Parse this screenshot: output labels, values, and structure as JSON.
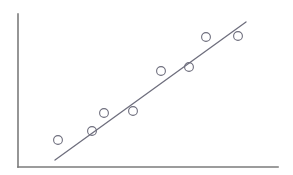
{
  "figure": {
    "width": 293,
    "height": 175,
    "background_color": "#ffffff",
    "caption": ""
  },
  "style": {
    "axis_color": "#7b7b7b",
    "axis_width": 1.6,
    "line_color": "#6e6e7d",
    "line_width": 1.3,
    "marker_color": "#6e6e7d",
    "marker_fill": "none",
    "marker_width": 1.1,
    "marker_radius": 4.4
  },
  "axes": {
    "y_axis": {
      "x": 18,
      "y_top": 14,
      "y_bottom": 167
    },
    "x_axis": {
      "y": 167,
      "x_left": 18,
      "x_right": 278
    },
    "ticks": [],
    "grid": false
  },
  "chart_data": {
    "type": "scatter",
    "title": "",
    "subtitle": "",
    "xlabel": "",
    "ylabel": "",
    "xlim": [
      0,
      293
    ],
    "ylim": [
      0,
      175
    ],
    "grid": false,
    "legend": null,
    "legend_position": "none",
    "annotations": [],
    "tick_labels": {
      "x": [],
      "y": []
    },
    "series": [
      {
        "name": "observations",
        "marker": "open-circle",
        "points_px": [
          {
            "x": 58,
            "y": 140
          },
          {
            "x": 92,
            "y": 131
          },
          {
            "x": 104,
            "y": 113
          },
          {
            "x": 133,
            "y": 111
          },
          {
            "x": 161,
            "y": 71
          },
          {
            "x": 189,
            "y": 67
          },
          {
            "x": 206,
            "y": 37
          },
          {
            "x": 238,
            "y": 36
          }
        ]
      },
      {
        "name": "trend-line",
        "type": "line",
        "x1": 55,
        "y1": 160,
        "x2": 246,
        "y2": 22
      }
    ]
  }
}
